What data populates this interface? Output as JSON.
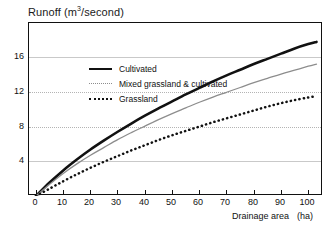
{
  "chart_data": {
    "type": "line",
    "title": "",
    "ylabel": "Runoff (m3/second)",
    "ylabel_parts": {
      "pre": "Runoff (m",
      "sup": "3",
      "post": "/second)"
    },
    "xlabel": "Drainage area",
    "xunit": "(ha)",
    "xlim": [
      0,
      105
    ],
    "ylim": [
      0,
      19.9
    ],
    "xticks": [
      0,
      10,
      20,
      30,
      40,
      50,
      60,
      70,
      80,
      90,
      100
    ],
    "xticklabels": [
      "0",
      "10",
      "20",
      "30",
      "40",
      "50",
      "60",
      "70",
      "80",
      "90",
      "100"
    ],
    "yticks": [
      4,
      8,
      12,
      16
    ],
    "yticklabels": [
      "4",
      "8",
      "12",
      "16"
    ],
    "grid": "horizontal",
    "legend_position": "upper-left-inside",
    "x": [
      0,
      5,
      10,
      15,
      20,
      25,
      30,
      35,
      40,
      45,
      50,
      55,
      60,
      65,
      70,
      75,
      80,
      85,
      90,
      95,
      100,
      103
    ],
    "series": [
      {
        "name": "Cultivated",
        "style": "solid-thick",
        "color": "#111111",
        "values": [
          0,
          1.55,
          2.95,
          4.2,
          5.35,
          6.4,
          7.4,
          8.35,
          9.25,
          10.1,
          10.9,
          11.7,
          12.45,
          13.2,
          13.9,
          14.55,
          15.2,
          15.8,
          16.4,
          17.0,
          17.5,
          17.75
        ]
      },
      {
        "name": "Mixed grassland & cultivated",
        "style": "fine-dotted",
        "color": "#8d8d8d",
        "values": [
          0,
          1.35,
          2.6,
          3.7,
          4.7,
          5.6,
          6.5,
          7.3,
          8.05,
          8.8,
          9.5,
          10.15,
          10.8,
          11.4,
          11.95,
          12.5,
          13.05,
          13.55,
          14.05,
          14.5,
          14.95,
          15.2
        ]
      },
      {
        "name": "Grassland",
        "style": "bold-dotted",
        "color": "#111111",
        "values": [
          0,
          0.85,
          1.7,
          2.5,
          3.25,
          3.95,
          4.6,
          5.25,
          5.85,
          6.45,
          7.0,
          7.5,
          8.0,
          8.5,
          8.95,
          9.4,
          9.85,
          10.3,
          10.7,
          11.05,
          11.35,
          11.5
        ]
      }
    ],
    "legend": [
      {
        "label": "Cultivated",
        "style": "solid-thick"
      },
      {
        "label": "Mixed grassland & cultivated",
        "style": "fine-dotted"
      },
      {
        "label": "Grassland",
        "style": "bold-dotted"
      }
    ],
    "colors": {
      "axis": "#111111",
      "grid": "#c9c9c9",
      "grid_dotted": "#b4b4b4",
      "series_primary": "#111111",
      "series_secondary": "#8d8d8d",
      "background": "#ffffff"
    }
  }
}
